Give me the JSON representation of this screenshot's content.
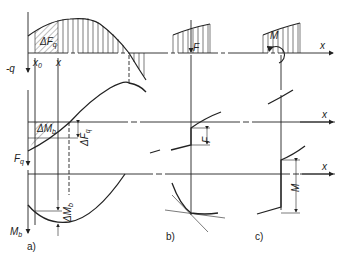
{
  "diagram": {
    "panels": [
      {
        "id": "a",
        "caption": "a)"
      },
      {
        "id": "b",
        "caption": "b)"
      },
      {
        "id": "c",
        "caption": "c)"
      }
    ],
    "labels": {
      "neg_q": "-q",
      "x0": "x",
      "x0_sub": "0",
      "x": "x",
      "delta_Fq_area": "ΔF",
      "delta_Fq_area_sub": "q",
      "delta_Mb_area": "ΔM",
      "delta_Mb_area_sub": "b",
      "delta_Fq_dim": "ΔF",
      "delta_Fq_dim_sub": "q",
      "Fq_axis": "F",
      "Fq_axis_sub": "q",
      "delta_Mb_dim": "ΔM",
      "delta_Mb_dim_sub": "b",
      "Mb_axis": "M",
      "Mb_axis_sub": "b",
      "F_force": "F",
      "F_jump": "F",
      "M_moment": "M",
      "M_jump": "M",
      "x_axis_top": "x",
      "x_axis_mid": "x",
      "x_axis_bot": "x"
    },
    "colors": {
      "ink": "#222222",
      "paper": "#ffffff"
    }
  }
}
